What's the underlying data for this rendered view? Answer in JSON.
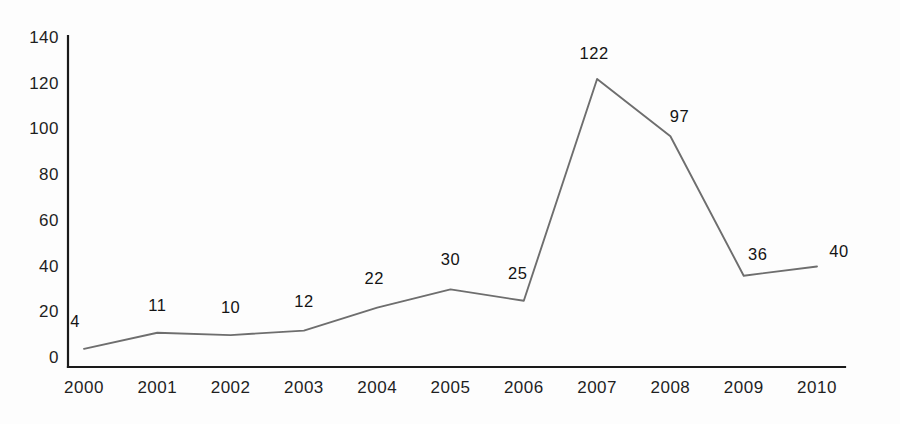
{
  "chart_data": {
    "type": "line",
    "title": "",
    "subtitle": "",
    "xlabel": "",
    "ylabel": "",
    "categories": [
      "2000",
      "2001",
      "2002",
      "2003",
      "2004",
      "2005",
      "2006",
      "2007",
      "2008",
      "2009",
      "2010"
    ],
    "values": [
      4,
      11,
      10,
      12,
      22,
      30,
      25,
      122,
      97,
      36,
      40
    ],
    "point_labels": [
      "4",
      "11",
      "10",
      "12",
      "22",
      "30",
      "25",
      "122",
      "97",
      "36",
      "40"
    ],
    "yticks": [
      "0",
      "20",
      "40",
      "60",
      "80",
      "100",
      "120",
      "140"
    ],
    "ytick_values": [
      0,
      20,
      40,
      60,
      80,
      100,
      120,
      140
    ],
    "ylim": [
      0,
      140
    ],
    "grid": false,
    "legend": null,
    "legend_position": "none",
    "series": [
      {
        "name": "",
        "values": [
          4,
          11,
          10,
          12,
          22,
          30,
          25,
          122,
          97,
          36,
          40
        ]
      }
    ],
    "colors": {
      "line": "#6e6e6e",
      "axis": "#1a1a1a",
      "background": "#fdfdfd",
      "text": "#1a1a1a"
    }
  },
  "geometry": {
    "plot_left": 68,
    "plot_right": 845,
    "baseline_y": 358,
    "axis_bottom_y": 367,
    "axis_top_y": 36,
    "px_per_unit": 2.287,
    "x_step": 73.3,
    "x_first": 84
  },
  "label_offsets": [
    {
      "dx": -9,
      "dy": -28
    },
    {
      "dx": 0,
      "dy": -28
    },
    {
      "dx": 0,
      "dy": -28
    },
    {
      "dx": 0,
      "dy": -30
    },
    {
      "dx": -3,
      "dy": -30
    },
    {
      "dx": 0,
      "dy": -30
    },
    {
      "dx": -6,
      "dy": -28
    },
    {
      "dx": -3,
      "dy": -26
    },
    {
      "dx": 9,
      "dy": -20
    },
    {
      "dx": 14,
      "dy": -22
    },
    {
      "dx": 22,
      "dy": -16
    }
  ]
}
